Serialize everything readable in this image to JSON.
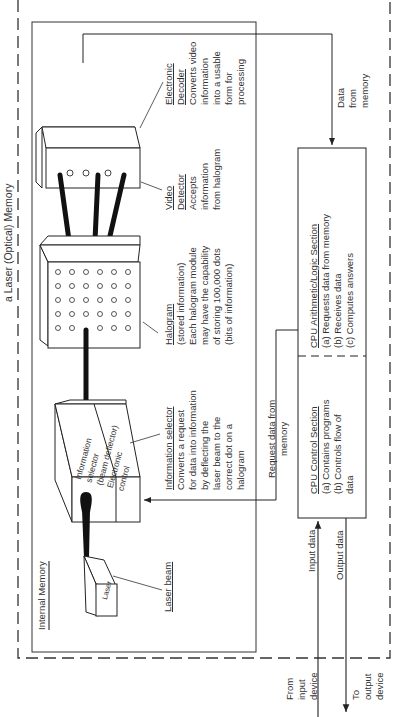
{
  "title": "a Laser (Optical) Memory",
  "internal_memory": {
    "label": "Internal Memory"
  },
  "components": {
    "laser": {
      "box_label": "Laser",
      "caption_title": "Laser beam"
    },
    "information_selector": {
      "box_lines": [
        "Information",
        "selector",
        "(beam deflector)",
        "Electronic",
        "control"
      ],
      "caption_title": "Information selector",
      "caption_lines": [
        "Converts a request",
        "for data into information",
        "by deflecting the",
        "laser beam to the",
        "correct dot on a",
        "halogram"
      ]
    },
    "halogram": {
      "caption_title": "Halogram",
      "caption_lines": [
        "(stored information)",
        "Each halogram module",
        "may have the capability",
        "of storing 100,000 dots",
        "(bits of information)"
      ],
      "grid_rows": 6,
      "grid_cols": 5
    },
    "video_detector": {
      "caption_title_lines": [
        "Video",
        "Detector"
      ],
      "caption_lines": [
        "Accepts",
        "information",
        "from halogram"
      ]
    },
    "electronic_decoder": {
      "caption_title_lines": [
        "Electronic",
        "Decoder"
      ],
      "caption_lines": [
        "Converts video",
        "information",
        "into a usable",
        "form for",
        "processing"
      ]
    }
  },
  "cpu": {
    "alu": {
      "title": "CPU Arithmetic/Logic Section",
      "items": [
        "(a) Requests data from memory",
        "(b) Receives data",
        "(c) Computes answers"
      ]
    },
    "control": {
      "title": "CPU Control Section",
      "items": [
        "(a) Contains programs",
        "(b) Controls flow of",
        "data"
      ]
    }
  },
  "flows": {
    "data_from_memory": [
      "Data",
      "from",
      "memory"
    ],
    "request_data": [
      "Request data from",
      "memory"
    ],
    "input_data": "Input data",
    "output_data": "Output data",
    "from_input_device": [
      "From",
      "input",
      "device"
    ],
    "to_output_device": [
      "To",
      "output",
      "device"
    ]
  }
}
